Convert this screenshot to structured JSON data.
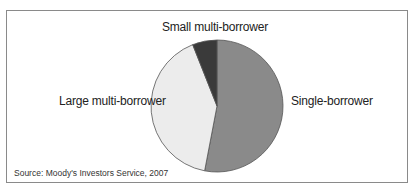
{
  "chart_data": {
    "type": "pie",
    "title": "",
    "categories": [
      "Single-borrower",
      "Large multi-borrower",
      "Small multi-borrower"
    ],
    "values": [
      53,
      41,
      6
    ],
    "colors": [
      "#8a8a8a",
      "#ececec",
      "#3a3a3a"
    ],
    "start_angle_deg": 0,
    "direction": "clockwise",
    "legend": "none (direct labels)",
    "source": "Source: Moody's Investors Service, 2007"
  },
  "labels": {
    "single": "Single-borrower",
    "large": "Large multi-borrower",
    "small": "Small multi-borrower"
  },
  "source": "Source: Moody's Investors Service, 2007"
}
